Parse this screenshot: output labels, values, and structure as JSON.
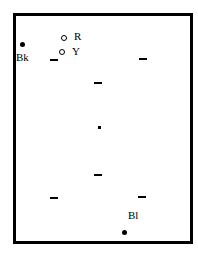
{
  "diagram": {
    "frame": {
      "left": 13,
      "top": 13,
      "right": 190,
      "bottom": 241,
      "stroke": "#000000"
    },
    "markers": [
      {
        "id": "bk",
        "type": "filled-dot",
        "x": 22,
        "y": 45,
        "label": "Bk",
        "label_x": 17,
        "label_y": 54
      },
      {
        "id": "r",
        "type": "ring",
        "x": 64,
        "y": 38,
        "label": "R",
        "label_x": 74,
        "label_y": 32
      },
      {
        "id": "y",
        "type": "ring",
        "x": 62,
        "y": 53,
        "label": "Y",
        "label_x": 72,
        "label_y": 47
      },
      {
        "id": "bl",
        "type": "filled-dot",
        "x": 124,
        "y": 233,
        "label": "Bl",
        "label_x": 128,
        "label_y": 211
      },
      {
        "id": "center",
        "type": "small-dot",
        "x": 99,
        "y": 127,
        "label": ""
      }
    ],
    "dashes": [
      {
        "x": 53,
        "y": 60
      },
      {
        "x": 143,
        "y": 59
      },
      {
        "x": 97,
        "y": 83
      },
      {
        "x": 97,
        "y": 175
      },
      {
        "x": 55,
        "y": 198
      },
      {
        "x": 141,
        "y": 197
      }
    ],
    "labels": {
      "bk": "Bk",
      "r": "R",
      "y": "Y",
      "bl": "Bl"
    }
  }
}
